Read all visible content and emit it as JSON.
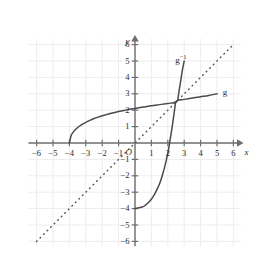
{
  "chart_data": {
    "type": "line",
    "title": "",
    "xlabel": "x",
    "ylabel": "y",
    "origin_label": "O",
    "xlim": [
      -6.6,
      6.6
    ],
    "ylim": [
      -6.4,
      6.4
    ],
    "grid": true,
    "x_ticks": [
      -6,
      -5,
      -4,
      -3,
      -2,
      -1,
      1,
      2,
      3,
      4,
      5,
      6
    ],
    "y_ticks": [
      6,
      5,
      4,
      3,
      2,
      1,
      -1,
      -2,
      -3,
      -4,
      -5,
      -6
    ],
    "x_tick_labels": [
      "-6",
      "-5",
      "-4",
      "-3",
      "-2",
      "-1",
      "1",
      "2",
      "3",
      "4",
      "5",
      "6"
    ],
    "y_tick_labels": [
      "6",
      "5",
      "4",
      "3",
      "2",
      "1",
      "-1",
      "-2",
      "-3",
      "-4",
      "-5",
      "-6"
    ],
    "axis_color": "#6f6f6f",
    "grid_color": "#ededed",
    "curve_color": "#4a4a4a",
    "series": [
      {
        "name": "g",
        "label": "g",
        "style": "solid",
        "label_point": [
          5.35,
          3.05
        ],
        "description": "square-root type curve from (-4,0) rising to (5,3)",
        "points": [
          [
            -4.0,
            0.0
          ],
          [
            -3.9,
            0.44
          ],
          [
            -3.8,
            0.62
          ],
          [
            -3.6,
            0.85
          ],
          [
            -3.4,
            1.02
          ],
          [
            -3.2,
            1.15
          ],
          [
            -3.0,
            1.26
          ],
          [
            -2.75,
            1.38
          ],
          [
            -2.5,
            1.49
          ],
          [
            -2.25,
            1.58
          ],
          [
            -2.0,
            1.66
          ],
          [
            -1.75,
            1.73
          ],
          [
            -1.5,
            1.8
          ],
          [
            -1.25,
            1.86
          ],
          [
            -1.0,
            1.92
          ],
          [
            -0.75,
            1.97
          ],
          [
            -0.5,
            2.02
          ],
          [
            -0.25,
            2.07
          ],
          [
            0.0,
            2.11
          ],
          [
            0.5,
            2.19
          ],
          [
            1.0,
            2.27
          ],
          [
            1.5,
            2.34
          ],
          [
            2.0,
            2.41
          ],
          [
            2.5,
            2.48
          ],
          [
            2.6,
            2.6
          ],
          [
            3.0,
            2.66
          ],
          [
            3.5,
            2.74
          ],
          [
            4.0,
            2.82
          ],
          [
            4.5,
            2.9
          ],
          [
            5.0,
            3.0
          ]
        ]
      },
      {
        "name": "g-inverse",
        "label": "g",
        "label_sup": "-1",
        "style": "solid",
        "label_point": [
          2.45,
          5.15
        ],
        "description": "reflection of g across y=x; exponential type curve from (0,-4) rising to (3,5)",
        "points": [
          [
            0.0,
            -4.0
          ],
          [
            0.44,
            -3.9
          ],
          [
            0.62,
            -3.8
          ],
          [
            0.85,
            -3.6
          ],
          [
            1.02,
            -3.4
          ],
          [
            1.15,
            -3.2
          ],
          [
            1.26,
            -3.0
          ],
          [
            1.38,
            -2.75
          ],
          [
            1.49,
            -2.5
          ],
          [
            1.58,
            -2.25
          ],
          [
            1.66,
            -2.0
          ],
          [
            1.73,
            -1.75
          ],
          [
            1.8,
            -1.5
          ],
          [
            1.86,
            -1.25
          ],
          [
            1.92,
            -1.0
          ],
          [
            1.97,
            -0.75
          ],
          [
            2.02,
            -0.5
          ],
          [
            2.07,
            -0.25
          ],
          [
            2.11,
            0.0
          ],
          [
            2.19,
            0.5
          ],
          [
            2.27,
            1.0
          ],
          [
            2.34,
            1.5
          ],
          [
            2.41,
            2.0
          ],
          [
            2.48,
            2.5
          ],
          [
            2.6,
            2.6
          ],
          [
            2.66,
            3.0
          ],
          [
            2.74,
            3.5
          ],
          [
            2.82,
            4.0
          ],
          [
            2.9,
            4.5
          ],
          [
            3.0,
            5.0
          ]
        ]
      },
      {
        "name": "identity-line",
        "label": "",
        "style": "dotted",
        "description": "line y = x, axis of symmetry between g and its inverse",
        "points": [
          [
            -6.0,
            -6.0
          ],
          [
            6.0,
            6.0
          ]
        ]
      }
    ],
    "annotations": [
      {
        "name": "intersection",
        "point": [
          2.6,
          2.6
        ],
        "label": ""
      }
    ]
  }
}
